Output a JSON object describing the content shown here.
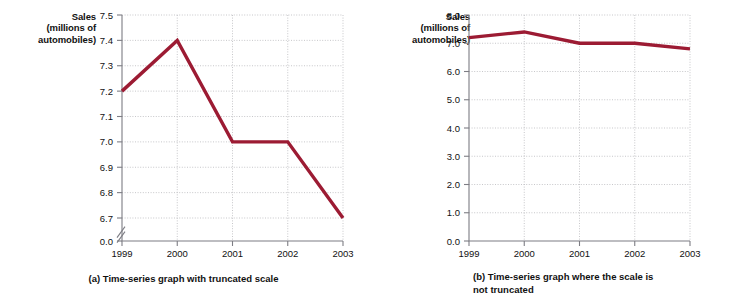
{
  "figure": {
    "background": "#ffffff",
    "series_color": "#9c1b33",
    "grid_color": "#b9b9bd",
    "axis_color": "#7d7d84"
  },
  "panels": [
    {
      "id": "a",
      "axis_title": "Sales\n(millions of\nautomobiles)",
      "caption": "(a) Time-series graph with truncated scale",
      "truncated": true,
      "chart_data": {
        "type": "line",
        "title": "(a) Time-series graph with truncated scale",
        "xlabel": "",
        "ylabel": "Sales (millions of automobiles)",
        "x": [
          "1999",
          "2000",
          "2001",
          "2002",
          "2003"
        ],
        "categories": [
          "1999",
          "2000",
          "2001",
          "2002",
          "2003"
        ],
        "series": [
          {
            "name": "Sales",
            "values": [
              7.2,
              7.4,
              7.0,
              7.0,
              6.7
            ],
            "color": "#9c1b33"
          }
        ],
        "values": [
          7.2,
          7.4,
          7.0,
          7.0,
          6.7
        ],
        "yticks": [
          "7.5",
          "7.4",
          "7.3",
          "7.2",
          "7.1",
          "7.0",
          "6.9",
          "6.8",
          "6.7",
          "0.0"
        ],
        "ytick_values": [
          7.5,
          7.4,
          7.3,
          7.2,
          7.1,
          7.0,
          6.9,
          6.8,
          6.7,
          0.0
        ],
        "ylim": [
          6.65,
          7.5
        ],
        "axis_truncated": true,
        "axis_break_between": [
          "6.7",
          "0.0"
        ],
        "grid": true,
        "legend": "none"
      }
    },
    {
      "id": "b",
      "axis_title": "Sales\n(millions of\nautomobiles)",
      "caption": "(b) Time-series graph where the scale is\nnot truncated",
      "truncated": false,
      "chart_data": {
        "type": "line",
        "title": "(b) Time-series graph where the scale is not truncated",
        "xlabel": "",
        "ylabel": "Sales (millions of automobiles)",
        "x": [
          "1999",
          "2000",
          "2001",
          "2002",
          "2003"
        ],
        "categories": [
          "1999",
          "2000",
          "2001",
          "2002",
          "2003"
        ],
        "series": [
          {
            "name": "Sales",
            "values": [
              7.2,
              7.4,
              7.0,
              7.0,
              6.8
            ],
            "color": "#9c1b33"
          }
        ],
        "values": [
          7.2,
          7.4,
          7.0,
          7.0,
          6.8
        ],
        "yticks": [
          "8.0",
          "7.0",
          "6.0",
          "5.0",
          "4.0",
          "3.0",
          "2.0",
          "1.0",
          "0.0"
        ],
        "ytick_values": [
          8.0,
          7.0,
          6.0,
          5.0,
          4.0,
          3.0,
          2.0,
          1.0,
          0.0
        ],
        "ylim": [
          0.0,
          8.0
        ],
        "axis_truncated": false,
        "grid": true,
        "legend": "none"
      }
    }
  ]
}
